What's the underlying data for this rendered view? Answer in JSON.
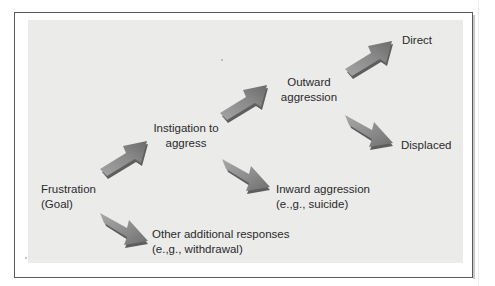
{
  "diagram": {
    "nodes": {
      "frustration": {
        "lines": [
          "Frustration",
          "(Goal)"
        ]
      },
      "instigation": {
        "lines": [
          "Instigation to",
          "aggress"
        ]
      },
      "other_responses": {
        "lines": [
          "Other additional responses",
          "(e.,g., withdrawal)"
        ]
      },
      "outward": {
        "lines": [
          "Outward",
          "aggression"
        ]
      },
      "inward": {
        "lines": [
          "Inward aggression",
          "(e.,g., suicide)"
        ]
      },
      "direct": {
        "lines": [
          "Direct"
        ]
      },
      "displaced": {
        "lines": [
          "Displaced"
        ]
      }
    },
    "edges": [
      {
        "from": "Frustration (Goal)",
        "to": "Instigation to aggress",
        "direction": "up-right"
      },
      {
        "from": "Frustration (Goal)",
        "to": "Other additional responses",
        "direction": "down-right"
      },
      {
        "from": "Instigation to aggress",
        "to": "Outward aggression",
        "direction": "up-right"
      },
      {
        "from": "Instigation to aggress",
        "to": "Inward aggression",
        "direction": "down-right"
      },
      {
        "from": "Outward aggression",
        "to": "Direct",
        "direction": "up-right"
      },
      {
        "from": "Outward aggression",
        "to": "Displaced",
        "direction": "down-right"
      }
    ],
    "colors": {
      "panel": "#ebebea",
      "frame_border": "#5a5a5a",
      "arrow_light": "#9a9a9a",
      "arrow_dark": "#6e6e6e",
      "text": "#2a2a2a"
    }
  }
}
